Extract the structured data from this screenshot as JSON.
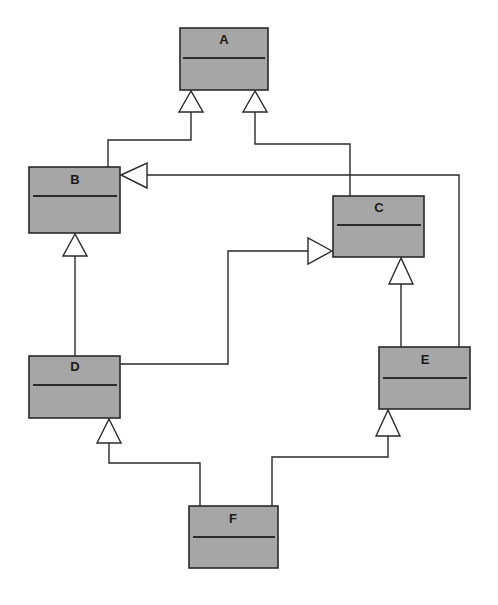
{
  "diagram": {
    "type": "UML class inheritance diagram",
    "colors": {
      "class_fill": "#a6a6a6",
      "stroke": "#2a2a2a",
      "arrowhead_fill": "#ffffff",
      "background": "#ffffff"
    },
    "classes": [
      {
        "id": "A",
        "label": "A"
      },
      {
        "id": "B",
        "label": "B"
      },
      {
        "id": "C",
        "label": "C"
      },
      {
        "id": "D",
        "label": "D"
      },
      {
        "id": "E",
        "label": "E"
      },
      {
        "id": "F",
        "label": "F"
      }
    ],
    "generalizations": [
      {
        "child": "B",
        "parent": "A"
      },
      {
        "child": "C",
        "parent": "A"
      },
      {
        "child": "E",
        "parent": "B"
      },
      {
        "child": "D",
        "parent": "B"
      },
      {
        "child": "D",
        "parent": "C"
      },
      {
        "child": "E",
        "parent": "C"
      },
      {
        "child": "F",
        "parent": "D"
      },
      {
        "child": "F",
        "parent": "E"
      }
    ]
  }
}
